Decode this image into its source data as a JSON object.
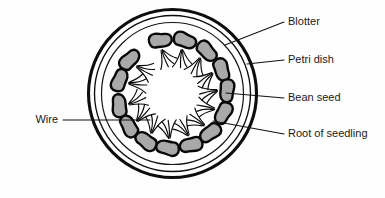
{
  "figure": {
    "background_color": "#fefefe"
  },
  "colors": {
    "outline": "#0d0d0d",
    "seed_outline": "#080808",
    "seed_fill": "#a9a9a9",
    "dish_fill": "#ffffff",
    "leader_line": "#111111",
    "label_text": "#1a1a1a"
  },
  "dish": {
    "center": {
      "x": 172.5,
      "y": 93.5
    },
    "outer_radius": 84,
    "rim_radius": 78,
    "blotter_radius": 71,
    "seed_ring_radius": 54
  },
  "labels": [
    {
      "id": "blotter",
      "text": "Blotter",
      "side": "right",
      "text_x": 288,
      "text_y": 22,
      "leader": {
        "x1": 284,
        "y1": 22,
        "x2": 225,
        "y2": 45
      },
      "points_to": "inner-blotter-circle"
    },
    {
      "id": "petri-dish",
      "text": "Petri dish",
      "side": "right",
      "text_x": 288,
      "text_y": 60,
      "leader": {
        "x1": 284,
        "y1": 60,
        "x2": 247,
        "y2": 64
      },
      "points_to": "outer-dish-rim"
    },
    {
      "id": "bean-seed",
      "text": "Bean seed",
      "side": "right",
      "text_x": 288,
      "text_y": 98,
      "leader": {
        "x1": 284,
        "y1": 98,
        "x2": 226,
        "y2": 93
      },
      "points_to": "seed-body"
    },
    {
      "id": "root-of-seedling",
      "text": "Root of seedling",
      "side": "right",
      "text_x": 288,
      "text_y": 134,
      "leader": {
        "x1": 284,
        "y1": 134,
        "x2": 213,
        "y2": 121
      },
      "points_to": "seedling-root"
    },
    {
      "id": "wire",
      "text": "Wire",
      "side": "left",
      "text_x": 58,
      "text_y": 120,
      "leader": {
        "x1": 63,
        "y1": 120,
        "x2": 150,
        "y2": 120
      },
      "points_to": "wire-inside-dish"
    }
  ],
  "seeds": {
    "count": 14,
    "description": "Bean seeds arranged in a ring around the inside of the petri dish, each with roots growing inward toward the centre.",
    "items": [
      {
        "index": 1,
        "angle_deg": -103,
        "seed_rotation_deg": -13
      },
      {
        "index": 2,
        "angle_deg": -77,
        "seed_rotation_deg": 13
      },
      {
        "index": 3,
        "angle_deg": -51,
        "seed_rotation_deg": 39
      },
      {
        "index": 4,
        "angle_deg": -26,
        "seed_rotation_deg": 64
      },
      {
        "index": 5,
        "angle_deg": -3,
        "seed_rotation_deg": 87
      },
      {
        "index": 6,
        "angle_deg": 21,
        "seed_rotation_deg": 111
      },
      {
        "index": 7,
        "angle_deg": 46,
        "seed_rotation_deg": 136
      },
      {
        "index": 8,
        "angle_deg": 70,
        "seed_rotation_deg": 160
      },
      {
        "index": 9,
        "angle_deg": 95,
        "seed_rotation_deg": 185
      },
      {
        "index": 10,
        "angle_deg": 119,
        "seed_rotation_deg": 209
      },
      {
        "index": 11,
        "angle_deg": 143,
        "seed_rotation_deg": 233
      },
      {
        "index": 12,
        "angle_deg": 167,
        "seed_rotation_deg": 257
      },
      {
        "index": 13,
        "angle_deg": 194,
        "seed_rotation_deg": 284
      },
      {
        "index": 14,
        "angle_deg": 218,
        "seed_rotation_deg": 308
      }
    ]
  },
  "caption": {
    "text": "",
    "visible": false
  }
}
